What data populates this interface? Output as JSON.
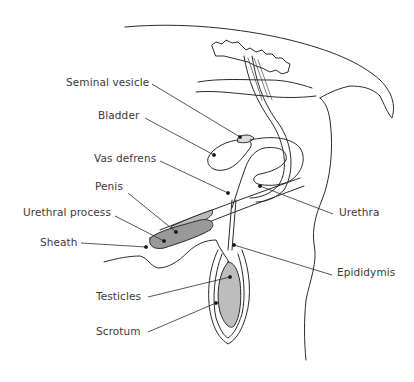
{
  "diagram": {
    "type": "anatomical-illustration",
    "line_color": "#2b2b2b",
    "label_color": "#3a3a3a",
    "background": "#ffffff",
    "labels": [
      {
        "id": "seminal-vesicle",
        "text": "Seminal vesicle",
        "x": 66,
        "y": 76
      },
      {
        "id": "bladder",
        "text": "Bladder",
        "x": 98,
        "y": 109
      },
      {
        "id": "vas-defrens",
        "text": "Vas defrens",
        "x": 94,
        "y": 152
      },
      {
        "id": "penis",
        "text": "Penis",
        "x": 95,
        "y": 180
      },
      {
        "id": "urethral-process",
        "text": "Urethral process",
        "x": 23,
        "y": 206
      },
      {
        "id": "sheath",
        "text": "Sheath",
        "x": 40,
        "y": 236
      },
      {
        "id": "testicles",
        "text": "Testicles",
        "x": 96,
        "y": 290
      },
      {
        "id": "scrotum",
        "text": "Scrotum",
        "x": 96,
        "y": 327
      },
      {
        "id": "urethra",
        "text": "Urethra",
        "x": 339,
        "y": 206
      },
      {
        "id": "epididymis",
        "text": "Epididymis",
        "x": 337,
        "y": 266
      }
    ]
  }
}
